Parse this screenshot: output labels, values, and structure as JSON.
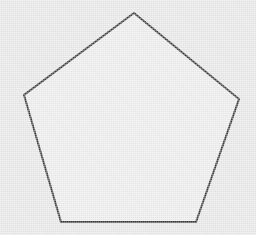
{
  "canvas": {
    "width": 256,
    "height": 235,
    "background_color": "#e7e7e7",
    "texture": "paper-noise"
  },
  "figure": {
    "name": "pentagon",
    "shape_type": "regular-polygon",
    "sides": 5,
    "label": "Pentagon",
    "stroke_color": "#3a3a3a",
    "stroke_width": 2,
    "fill_color": "#ececec",
    "line_join": "miter",
    "closed": true,
    "orientation": "vertex-up",
    "center": {
      "x": 130,
      "y": 122
    },
    "circumradius": 110,
    "vertices": [
      {
        "name": "top",
        "x": 134,
        "y": 13
      },
      {
        "name": "right",
        "x": 239,
        "y": 99
      },
      {
        "name": "bottom-right",
        "x": 196,
        "y": 222
      },
      {
        "name": "bottom-left",
        "x": 61,
        "y": 222
      },
      {
        "name": "left",
        "x": 24,
        "y": 95
      }
    ],
    "points_attr": "134,13 239,99 196,222 61,222 24,95"
  }
}
